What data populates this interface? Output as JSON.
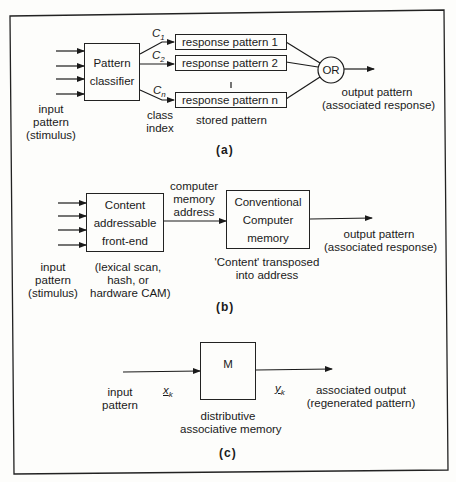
{
  "panel_a": {
    "classifier_label_1": "Pattern",
    "classifier_label_2": "classifier",
    "input_label_1": "input",
    "input_label_2": "pattern",
    "input_label_3": "(stimulus)",
    "class_symbols": [
      {
        "base": "C",
        "sub": "1"
      },
      {
        "base": "C",
        "sub": "2"
      },
      {
        "base": "C",
        "sub": "n"
      }
    ],
    "class_index_label_1": "class",
    "class_index_label_2": "index",
    "responses": [
      "response pattern 1",
      "response pattern 2",
      "response pattern n"
    ],
    "stored_label": "stored pattern",
    "or_label": "OR",
    "output_label_1": "output pattern",
    "output_label_2": "(associated response)",
    "caption": "(a)"
  },
  "panel_b": {
    "frontend_label_1": "Content",
    "frontend_label_2": "addressable",
    "frontend_label_3": "front-end",
    "input_label_1": "input",
    "input_label_2": "pattern",
    "input_label_3": "(stimulus)",
    "frontend_note_1": "(lexical scan,",
    "frontend_note_2": "hash, or",
    "frontend_note_3": "hardware CAM)",
    "address_label_1": "computer",
    "address_label_2": "memory",
    "address_label_3": "address",
    "memory_label_1": "Conventional",
    "memory_label_2": "Computer",
    "memory_label_3": "memory",
    "memory_note_1": "'Content' transposed",
    "memory_note_2": "into address",
    "output_label_1": "output pattern",
    "output_label_2": "(associated response)",
    "caption": "(b)"
  },
  "panel_c": {
    "memory_label": "M",
    "input_label_1": "input",
    "input_label_2": "pattern",
    "x_symbol": {
      "base": "x",
      "sub": "k"
    },
    "y_symbol": {
      "base": "y",
      "sub": "k"
    },
    "memory_note_1": "distributive",
    "memory_note_2": "associative memory",
    "output_label_1": "associated output",
    "output_label_2": "(regenerated pattern)",
    "caption": "(c)"
  }
}
